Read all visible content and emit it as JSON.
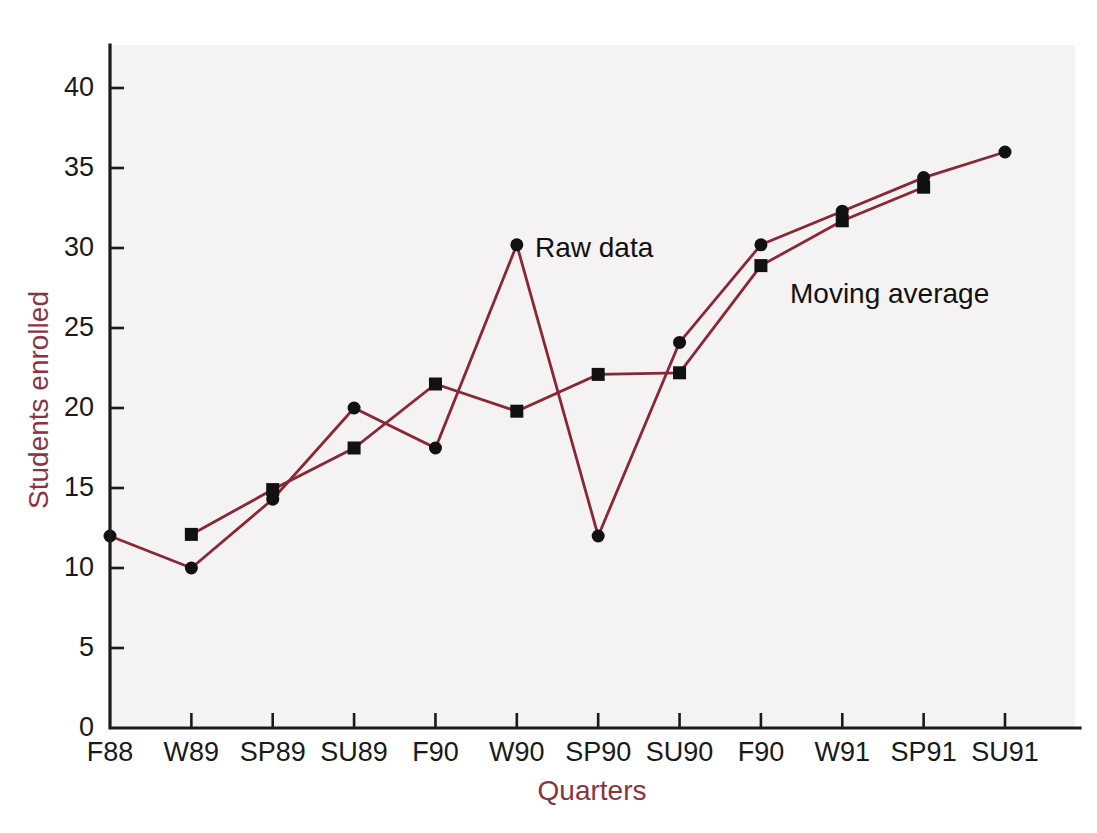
{
  "chart_data": {
    "type": "line",
    "title": "",
    "xlabel": "Quarters",
    "ylabel": "Students enrolled",
    "categories": [
      "F88",
      "W89",
      "SP89",
      "SU89",
      "F90",
      "W90",
      "SP90",
      "SU90",
      "F90",
      "W91",
      "SP91",
      "SU91"
    ],
    "ylim": [
      0,
      42
    ],
    "yticks": [
      0,
      5,
      10,
      15,
      20,
      25,
      30,
      35,
      40
    ],
    "ytick_labels": [
      "0",
      "5",
      "10",
      "15",
      "20",
      "25",
      "30",
      "35",
      "40"
    ],
    "grid": false,
    "legend": "inline-annotations",
    "series": [
      {
        "name": "Raw data",
        "marker": "circle",
        "color": "#8B2635",
        "values": [
          12,
          10,
          14.3,
          20,
          17.5,
          30.2,
          12,
          24.1,
          30.2,
          32.3,
          34.4,
          36
        ]
      },
      {
        "name": "Moving average",
        "marker": "square",
        "color": "#8B2635",
        "values": [
          null,
          12.1,
          14.9,
          17.5,
          21.5,
          19.8,
          22.1,
          22.2,
          28.9,
          31.7,
          33.8,
          null
        ]
      }
    ],
    "annotations": [
      {
        "text": "Raw data",
        "x_category": "W90",
        "y_value": 30.2
      },
      {
        "text": "Moving average",
        "x_category": "F90",
        "y_value": 27.0
      }
    ]
  },
  "axes": {
    "y_title": "Students enrolled",
    "x_title": "Quarters",
    "accent_color": "#8c3340",
    "line_color": "#8B2635",
    "marker_color": "#111111"
  },
  "labels": {
    "raw_data": "Raw data",
    "moving_average": "Moving average"
  }
}
